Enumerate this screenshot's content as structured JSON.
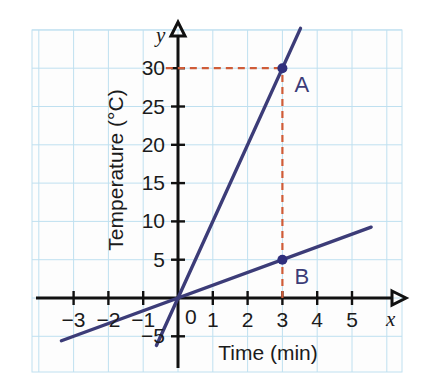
{
  "chart_data": {
    "type": "line",
    "title": "",
    "xlabel": "Time (min)",
    "ylabel": "Temperature (°C)",
    "xlim": [
      -3.8,
      5.8
    ],
    "ylim": [
      -7.5,
      37
    ],
    "grid": true,
    "legend": "none",
    "x_axis_variable": "x",
    "y_axis_variable": "y",
    "origin_label": "0",
    "xticks": [
      {
        "value": -3,
        "label": "−3"
      },
      {
        "value": -2,
        "label": "−2"
      },
      {
        "value": -1,
        "label": "−1"
      },
      {
        "value": 1,
        "label": "1"
      },
      {
        "value": 2,
        "label": "2"
      },
      {
        "value": 3,
        "label": "3"
      },
      {
        "value": 4,
        "label": "4"
      },
      {
        "value": 5,
        "label": "5"
      }
    ],
    "yticks": [
      {
        "value": -5,
        "label": "−5"
      },
      {
        "value": 5,
        "label": "5"
      },
      {
        "value": 10,
        "label": "10"
      },
      {
        "value": 15,
        "label": "15"
      },
      {
        "value": 20,
        "label": "20"
      },
      {
        "value": 25,
        "label": "25"
      },
      {
        "value": 30,
        "label": "30"
      }
    ],
    "series": [
      {
        "name": "steep-line",
        "slope": 10,
        "intercept": 0,
        "color": "#3c3c78",
        "x_start": -0.62,
        "x_end": 3.52,
        "comment": "passes through origin and point A"
      },
      {
        "name": "shallow-line",
        "slope": 1.6667,
        "intercept": 0,
        "color": "#3c3c78",
        "x_start": -3.35,
        "x_end": 5.55,
        "comment": "passes through origin and point B"
      }
    ],
    "points": [
      {
        "label": "A",
        "x": 3,
        "y": 30,
        "color": "#2f2f7d"
      },
      {
        "label": "B",
        "x": 3,
        "y": 5,
        "color": "#2f2f7d"
      }
    ],
    "reference_lines": [
      {
        "name": "horizontal-30",
        "orientation": "horizontal",
        "value": 30,
        "from_x": -0.35,
        "to_x": 3,
        "color": "#cf5c38",
        "style": "dashed"
      },
      {
        "name": "vertical-3",
        "orientation": "vertical",
        "value": 3,
        "from_y": 0,
        "to_y": 30,
        "color": "#cf5c38",
        "style": "dashed"
      }
    ],
    "colors": {
      "line": "#3c3c78",
      "reference": "#cf5c38",
      "grid": "#bfe0f0",
      "axis": "#111111",
      "point": "#2f2f7d",
      "background": "#fdfdfd"
    }
  }
}
